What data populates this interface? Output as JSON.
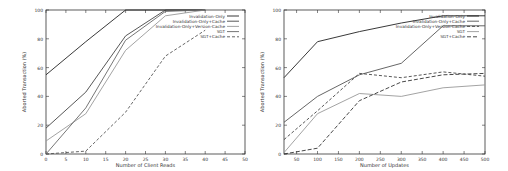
{
  "chart_data": [
    {
      "type": "line",
      "title": "",
      "xlabel": "Number of Client Reads",
      "ylabel": "Aborted Transaction (%)",
      "xlim": [
        0,
        50
      ],
      "ylim": [
        0,
        100
      ],
      "xticks": [
        0,
        5,
        10,
        15,
        20,
        25,
        30,
        35,
        40,
        45,
        50
      ],
      "yticks": [
        0,
        20,
        40,
        60,
        80,
        100
      ],
      "grid": false,
      "legend_position": "top-right",
      "x": [
        0,
        10,
        20,
        30,
        40
      ],
      "series": [
        {
          "name": "Invalidation-Only",
          "values": [
            55,
            78,
            100,
            100,
            100
          ],
          "color": "#222222",
          "dash": ""
        },
        {
          "name": "Invalidation-Only+Cache",
          "values": [
            18,
            43,
            82,
            100,
            100
          ],
          "color": "#444444",
          "dash": ""
        },
        {
          "name": "Invalidation-Only+Version-Cache",
          "values": [
            9,
            28,
            72,
            96,
            100
          ],
          "color": "#999999",
          "dash": ""
        },
        {
          "name": "SGT",
          "values": [
            0,
            32,
            79,
            99,
            100
          ],
          "color": "#666666",
          "dash": ""
        },
        {
          "name": "SGT+Cache",
          "values": [
            0,
            2,
            29,
            68,
            86
          ],
          "color": "#555555",
          "dash": "3,2"
        }
      ]
    },
    {
      "type": "line",
      "title": "",
      "xlabel": "Number of Updates",
      "ylabel": "Aborted Transaction (%)",
      "xlim": [
        20,
        500
      ],
      "ylim": [
        0,
        100
      ],
      "xticks": [
        50,
        100,
        150,
        200,
        250,
        300,
        350,
        400,
        450,
        500
      ],
      "yticks": [
        0,
        20,
        40,
        60,
        80,
        100
      ],
      "grid": false,
      "legend_position": "top-right",
      "x": [
        20,
        100,
        200,
        300,
        400,
        500
      ],
      "series": [
        {
          "name": "Invalidation-Only",
          "values": [
            53,
            78,
            85,
            91,
            96,
            96
          ],
          "color": "#222222",
          "dash": ""
        },
        {
          "name": "Invalidation-Only+Cache",
          "values": [
            22,
            40,
            55,
            63,
            89,
            89
          ],
          "color": "#555555",
          "dash": ""
        },
        {
          "name": "Invalidation-Only+Version-Cache",
          "values": [
            10,
            30,
            56,
            53,
            57,
            54
          ],
          "color": "#444444",
          "dash": "3,2"
        },
        {
          "name": "SGT",
          "values": [
            1,
            28,
            42,
            40,
            46,
            48
          ],
          "color": "#999999",
          "dash": ""
        },
        {
          "name": "SGT+Cache",
          "values": [
            0,
            4,
            37,
            50,
            55,
            56
          ],
          "color": "#333333",
          "dash": "4,2"
        }
      ]
    }
  ]
}
